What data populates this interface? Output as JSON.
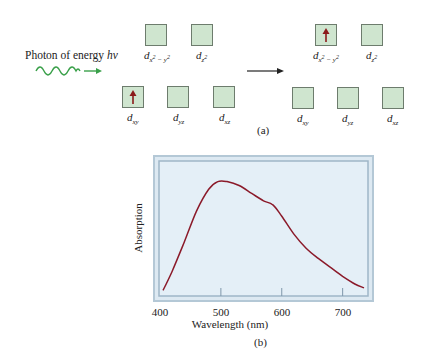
{
  "figure_a": {
    "photon_label": "Photon of energy ",
    "photon_symbol": "hν",
    "caption": "(a)",
    "colors": {
      "photon_wave": "#3aa04a",
      "electron_arrow": "#8b1a1a",
      "orbital_fill": "#cfe5cf",
      "orbital_border": "#6d7c6d"
    },
    "before": {
      "upper": [
        {
          "name": "d",
          "sub": "x",
          "sup_a": "2",
          "mid": " − y",
          "sup_b": "2",
          "electron": false
        },
        {
          "name": "d",
          "sub": "z",
          "sup_a": "2",
          "electron": false
        }
      ],
      "lower": [
        {
          "name": "d",
          "sub": "xy",
          "electron": true
        },
        {
          "name": "d",
          "sub": "yz",
          "electron": false
        },
        {
          "name": "d",
          "sub": "xz",
          "electron": false
        }
      ]
    },
    "after": {
      "upper": [
        {
          "name": "d",
          "sub": "x",
          "sup_a": "2",
          "mid": " − y",
          "sup_b": "2",
          "electron": true
        },
        {
          "name": "d",
          "sub": "z",
          "sup_a": "2",
          "electron": false
        }
      ],
      "lower": [
        {
          "name": "d",
          "sub": "xy",
          "electron": false
        },
        {
          "name": "d",
          "sub": "yz",
          "electron": false
        },
        {
          "name": "d",
          "sub": "xz",
          "electron": false
        }
      ]
    }
  },
  "chart_data": {
    "type": "line",
    "title": "",
    "caption": "(b)",
    "xlabel": "Wavelength (nm)",
    "ylabel": "Absorption",
    "xlim": [
      400,
      740
    ],
    "ylim": [
      0,
      1
    ],
    "xticks": [
      400,
      500,
      600,
      700
    ],
    "xtick_labels": [
      "400",
      "500",
      "600",
      "700"
    ],
    "grid": false,
    "legend": null,
    "series": [
      {
        "name": "Absorption spectrum",
        "color": "#8b1a2a",
        "x": [
          405,
          420,
          440,
          460,
          480,
          495,
          510,
          530,
          550,
          570,
          585,
          600,
          620,
          640,
          660,
          680,
          700,
          720,
          735
        ],
        "y": [
          0.02,
          0.17,
          0.4,
          0.64,
          0.81,
          0.87,
          0.87,
          0.84,
          0.78,
          0.72,
          0.69,
          0.6,
          0.46,
          0.35,
          0.27,
          0.2,
          0.13,
          0.07,
          0.04
        ]
      }
    ],
    "colors": {
      "plot_bg": "#e3eef6",
      "frame": "#a9bfd0",
      "curve": "#8b1a2a"
    }
  }
}
